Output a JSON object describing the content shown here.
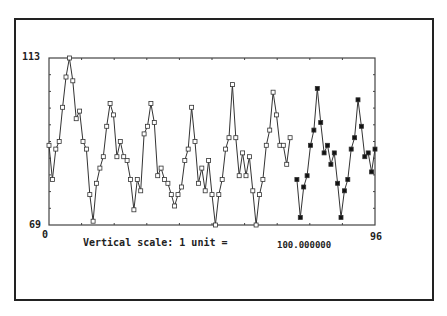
{
  "chart_data": {
    "type": "line",
    "title": "",
    "xlabel": "",
    "ylabel": "",
    "xlim": [
      0,
      96
    ],
    "ylim": [
      69,
      113
    ],
    "grid": false,
    "legend": null,
    "x_tick_labels": [
      "0",
      "96"
    ],
    "y_tick_labels": [
      "69",
      "113"
    ],
    "x_ticks_count": 10,
    "y_ticks_count": 10,
    "series": [
      {
        "name": "observed",
        "marker": "hollow-square",
        "x_start": 0,
        "values": [
          90,
          81,
          89,
          91,
          100,
          108,
          113,
          107,
          97,
          99,
          91,
          89,
          77,
          70,
          80,
          84,
          87,
          95,
          101,
          98,
          87,
          91,
          87,
          86,
          81,
          73,
          81,
          78,
          93,
          95,
          101,
          96,
          82,
          84,
          81,
          80,
          77,
          74,
          77,
          79,
          86,
          89,
          100,
          91,
          80,
          84,
          78,
          86,
          77,
          69,
          77,
          81,
          89,
          92,
          106,
          92,
          82,
          88,
          82,
          87,
          78,
          69,
          77,
          81,
          90,
          94,
          104,
          98,
          90,
          90,
          85,
          92
        ]
      },
      {
        "name": "forecast",
        "marker": "filled-square",
        "x_start": 73,
        "values": [
          81,
          71,
          79,
          82,
          90,
          94,
          105,
          96,
          88,
          90,
          85,
          88,
          80,
          71,
          78,
          81,
          89,
          92,
          102,
          95,
          87,
          88,
          83,
          89
        ]
      }
    ],
    "annotation": "Vertical scale: 1 unit =",
    "scale_value": "100.000000"
  },
  "labels": {
    "y_max": "113",
    "y_min": "69",
    "x_min": "0",
    "x_max": "96",
    "scale_caption": "Vertical scale: 1 unit =",
    "scale_value": "100.000000"
  },
  "colors": {
    "line": "#333333",
    "axis": "#444444",
    "frame": "#222222",
    "background": "#ffffff"
  }
}
